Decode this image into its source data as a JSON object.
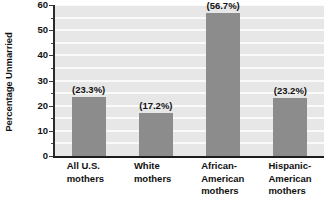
{
  "chart_data": {
    "type": "bar",
    "title": "",
    "xlabel": "",
    "ylabel": "Percentage Unmarried",
    "ylim": [
      0,
      60
    ],
    "grid": true,
    "legend": "none",
    "categories": [
      "All U.S. mothers",
      "White mothers",
      "African-American mothers",
      "Hispanic-American mothers"
    ],
    "category_lines": [
      [
        "All U.S.",
        "mothers"
      ],
      [
        "White",
        "mothers"
      ],
      [
        "African-",
        "American",
        "mothers"
      ],
      [
        "Hispanic-",
        "American",
        "mothers"
      ]
    ],
    "values": [
      23.3,
      17.2,
      56.7,
      23.2
    ],
    "data_labels": [
      "(23.3%)",
      "(17.2%)",
      "(56.7%)",
      "(23.2%)"
    ],
    "y_ticks_major": [
      0,
      10,
      20,
      30,
      40,
      50,
      60
    ],
    "y_tick_labels": [
      "0",
      "10",
      "20",
      "30",
      "40",
      "50",
      "60"
    ],
    "y_ticks_minor": [
      5,
      15,
      25,
      35,
      45,
      55
    ],
    "colors": {
      "bar": "#8c8c8c",
      "plot_background": "#e7e7e7",
      "gridline": "#fafafa",
      "axis": "#1d1d1d",
      "text": "#111111",
      "page_background": "#ffffff"
    }
  }
}
